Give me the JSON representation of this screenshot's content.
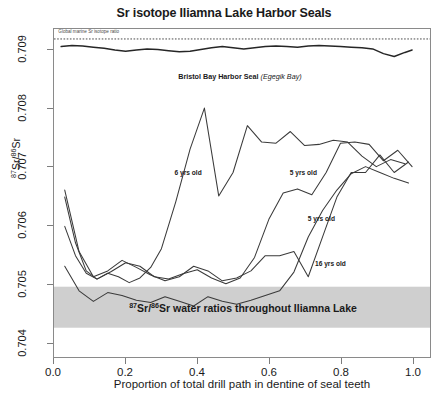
{
  "chart_data": {
    "type": "line",
    "title": "Sr isotope Iliamna Lake Harbor Seals",
    "xlabel": "Proportion of total drill path in dentine of seal teeth",
    "ylabel": "87Sr/86Sr",
    "ylabel_parts": {
      "pre": "87",
      "mid": "Sr/",
      "post": "86",
      "tail": "Sr"
    },
    "xlim": [
      0.0,
      1.05
    ],
    "ylim": [
      0.70375,
      0.70935
    ],
    "grid": false,
    "legend": "none (series labelled inline)",
    "xticks": [
      "0.0",
      "0.2",
      "0.4",
      "0.6",
      "0.8",
      "1.0"
    ],
    "xtick_values": [
      0.0,
      0.2,
      0.4,
      0.6,
      0.8,
      1.0
    ],
    "yticks": [
      "0.709",
      "0.708",
      "0.707",
      "0.706",
      "0.705",
      "0.704"
    ],
    "ytick_values": [
      0.709,
      0.708,
      0.707,
      0.706,
      0.705,
      0.704
    ],
    "reference_line": {
      "label": "Global marine Sr isotope ratio",
      "value": 0.70918,
      "style": "dotted"
    },
    "shaded_band": {
      "label_plain": "87Sr/86Sr water ratios throughout Iliamna Lake",
      "label_parts": {
        "pre": "87",
        "mid": "Sr/",
        "post": "86",
        "tail": "Sr water ratios throughout Iliamna Lake"
      },
      "y_min": 0.70425,
      "y_max": 0.70495,
      "color": "#cfcfcf"
    },
    "series": [
      {
        "name": "Bristol Bay Harbor Seal (Egegik Bay)",
        "label": "Bristol Bay Harbor Seal",
        "label_italic": "(Egegik Bay)",
        "color": "#262626",
        "x": [
          0.02,
          0.05,
          0.08,
          0.11,
          0.14,
          0.17,
          0.2,
          0.23,
          0.26,
          0.29,
          0.32,
          0.35,
          0.38,
          0.41,
          0.44,
          0.47,
          0.5,
          0.53,
          0.56,
          0.59,
          0.62,
          0.65,
          0.68,
          0.71,
          0.74,
          0.77,
          0.8,
          0.83,
          0.86,
          0.89,
          0.92,
          0.95,
          0.98,
          1.0
        ],
        "y": [
          0.70905,
          0.70907,
          0.70906,
          0.70904,
          0.70902,
          0.70899,
          0.70897,
          0.70899,
          0.70901,
          0.709,
          0.70898,
          0.70896,
          0.70897,
          0.709,
          0.70903,
          0.70905,
          0.70903,
          0.70901,
          0.70903,
          0.70905,
          0.70906,
          0.70905,
          0.70904,
          0.70906,
          0.70907,
          0.70906,
          0.70905,
          0.70904,
          0.70903,
          0.70901,
          0.70893,
          0.70888,
          0.70895,
          0.70899
        ]
      },
      {
        "name": "6 yrs old",
        "label": "6 yrs old",
        "color": "#3a3a3a",
        "x": [
          0.03,
          0.06,
          0.09,
          0.12,
          0.15,
          0.18,
          0.21,
          0.24,
          0.27,
          0.3,
          0.34,
          0.38,
          0.42,
          0.46,
          0.5,
          0.54,
          0.58,
          0.62,
          0.66,
          0.7,
          0.74,
          0.78,
          0.82,
          0.86,
          0.9,
          0.94,
          0.98
        ],
        "y": [
          0.70648,
          0.7057,
          0.70522,
          0.70508,
          0.70518,
          0.70512,
          0.70502,
          0.7051,
          0.70528,
          0.7056,
          0.7064,
          0.7073,
          0.708,
          0.7065,
          0.7069,
          0.7077,
          0.70742,
          0.7074,
          0.7076,
          0.70736,
          0.70738,
          0.70745,
          0.70742,
          0.70718,
          0.707,
          0.70712,
          0.70705
        ]
      },
      {
        "name": "5 yrs old (upper)",
        "label": "5 yrs old",
        "color": "#3a3a3a",
        "x": [
          0.03,
          0.06,
          0.09,
          0.12,
          0.16,
          0.2,
          0.24,
          0.28,
          0.32,
          0.36,
          0.4,
          0.44,
          0.48,
          0.52,
          0.56,
          0.6,
          0.64,
          0.68,
          0.72,
          0.76,
          0.8,
          0.84,
          0.88,
          0.92,
          0.96,
          1.0
        ],
        "y": [
          0.70598,
          0.70548,
          0.70518,
          0.70508,
          0.70521,
          0.70536,
          0.7053,
          0.70512,
          0.70508,
          0.70517,
          0.70524,
          0.7051,
          0.705,
          0.7051,
          0.70545,
          0.7061,
          0.70655,
          0.70662,
          0.70652,
          0.7069,
          0.7074,
          0.70742,
          0.70738,
          0.7071,
          0.70728,
          0.707
        ]
      },
      {
        "name": "5 yrs old (lower)",
        "label": "5 yrs old",
        "color": "#3a3a3a",
        "x": [
          0.03,
          0.07,
          0.11,
          0.15,
          0.19,
          0.23,
          0.27,
          0.31,
          0.35,
          0.39,
          0.43,
          0.47,
          0.51,
          0.55,
          0.59,
          0.63,
          0.67,
          0.71,
          0.75,
          0.79,
          0.83,
          0.87,
          0.91,
          0.95,
          0.99
        ],
        "y": [
          0.7066,
          0.70555,
          0.70512,
          0.70522,
          0.7054,
          0.70528,
          0.70515,
          0.70505,
          0.70512,
          0.7053,
          0.70522,
          0.70505,
          0.7051,
          0.70522,
          0.70548,
          0.70548,
          0.70555,
          0.70512,
          0.7058,
          0.70648,
          0.7069,
          0.7069,
          0.7072,
          0.7069,
          0.70708
        ]
      },
      {
        "name": "16 yrs old",
        "label": "16 yrs old",
        "color": "#3a3a3a",
        "x": [
          0.03,
          0.07,
          0.11,
          0.15,
          0.19,
          0.23,
          0.27,
          0.31,
          0.35,
          0.39,
          0.43,
          0.47,
          0.51,
          0.55,
          0.59,
          0.63,
          0.67,
          0.71,
          0.75,
          0.79,
          0.83,
          0.87,
          0.91,
          0.95,
          0.99
        ],
        "y": [
          0.7053,
          0.70488,
          0.7047,
          0.70485,
          0.7048,
          0.70472,
          0.70468,
          0.70478,
          0.7047,
          0.70462,
          0.70478,
          0.7047,
          0.70465,
          0.70472,
          0.7048,
          0.70488,
          0.7052,
          0.7058,
          0.70625,
          0.7066,
          0.70688,
          0.707,
          0.7069,
          0.7068,
          0.70672
        ]
      }
    ]
  },
  "annotations": {
    "global_marine": "Global marine Sr isotope ratio",
    "bristol_main": "Bristol Bay Harbor Seal",
    "bristol_italic": "(Egegik Bay)",
    "six_yrs": "6 yrs old",
    "five_yrs_upper": "5 yrs old",
    "five_yrs_lower": "5 yrs old",
    "sixteen_yrs": "16 yrs old",
    "band_tail": "Sr water ratios throughout Iliamna Lake",
    "sup_87": "87",
    "sup_86": "86",
    "sr_slash": "Sr/",
    "sr": "Sr"
  },
  "caption": ""
}
